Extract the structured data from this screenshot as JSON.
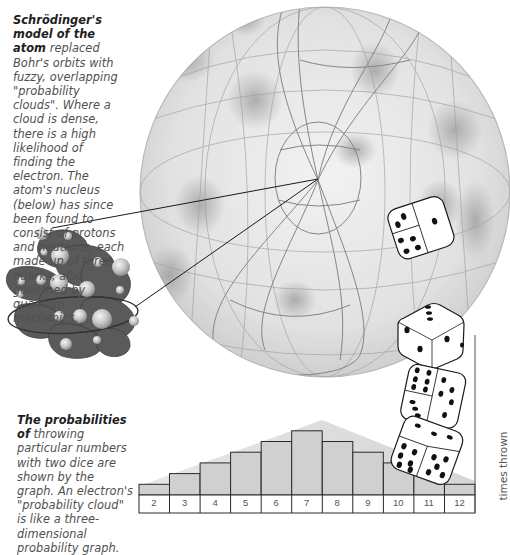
{
  "captions": {
    "top": {
      "title": "Schrödinger's model of the atom",
      "body": " replaced Bohr's orbits with fuzzy, overlapping \"probability clouds\". Where a cloud is dense, there is a high likelihood of finding the electron. The atom's nucleus (below) has since been found to consist of protons and neutrons, each made up of three quarks, also governed by quantum mechanics."
    },
    "bottom": {
      "title": "The probabilities of",
      "body": " throwing particular numbers with two dice are shown by the graph. An electron's \"probability cloud\" is like a three-dimensional probability graph."
    }
  },
  "illustrations": {
    "sphere": "probability-cloud-sphere",
    "nucleus": "atomic-nucleus-quarks",
    "dice": [
      "die-top",
      "die-upper-middle",
      "die-lower-middle",
      "die-bottom"
    ]
  },
  "colors": {
    "bar_fill": "#d2d2d2",
    "bar_stroke": "#2a2a2a",
    "nucleus": "#555555",
    "nucleon": "#c9c9c9",
    "sphere_shade": "#bdbdbd"
  },
  "chart_data": {
    "type": "bar",
    "title": "",
    "xlabel": "",
    "ylabel": "times thrown",
    "categories": [
      "2",
      "3",
      "4",
      "5",
      "6",
      "7",
      "8",
      "9",
      "10",
      "11",
      "12"
    ],
    "values": [
      1,
      2,
      3,
      4,
      5,
      6,
      5,
      4,
      3,
      2,
      1
    ],
    "ylim": [
      0,
      6.5
    ],
    "grid": false,
    "legend": "none"
  }
}
